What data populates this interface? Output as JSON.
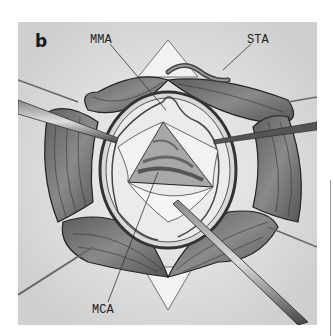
{
  "figure": {
    "panel_label": "b",
    "labels": {
      "mma": "MMA",
      "sta": "STA",
      "mca": "MCA"
    },
    "colors": {
      "background": "#dcdcdc",
      "muscle": "#7a7a7a",
      "muscle_dark": "#3a3a3a",
      "dura": "#efefef",
      "instrument": "#4a4a4a"
    }
  }
}
